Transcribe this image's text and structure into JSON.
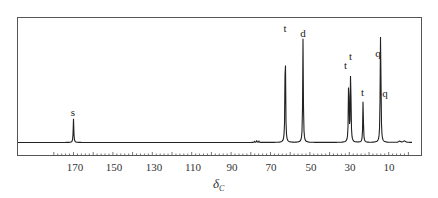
{
  "chart_data": {
    "type": "line",
    "title": "",
    "subtitle": "",
    "xlabel": "δC",
    "xlabel_main": "δ",
    "xlabel_sub": "C",
    "ylabel": "",
    "x_reversed": true,
    "xlim": [
      180,
      0
    ],
    "grid": false,
    "legend": null,
    "x_ticks": [
      170,
      150,
      130,
      110,
      90,
      70,
      50,
      30,
      10
    ],
    "x_tick_labels": [
      "170",
      "150",
      "130",
      "110",
      "90",
      "70",
      "50",
      "30",
      "10"
    ],
    "peaks": [
      {
        "ppm": 170.0,
        "height": 0.22,
        "multiplicity": "s"
      },
      {
        "ppm": 77.0,
        "height": 0.01,
        "multiplicity": "",
        "note": "solvent triplet"
      },
      {
        "ppm": 62.5,
        "height": 1.0,
        "multiplicity": "t"
      },
      {
        "ppm": 53.5,
        "height": 0.96,
        "multiplicity": "d"
      },
      {
        "ppm": 30.3,
        "height": 0.66,
        "multiplicity": "t"
      },
      {
        "ppm": 29.3,
        "height": 0.74,
        "multiplicity": "t"
      },
      {
        "ppm": 23.0,
        "height": 0.4,
        "multiplicity": "t"
      },
      {
        "ppm": 14.2,
        "height": 0.76,
        "multiplicity": "q"
      },
      {
        "ppm": 14.0,
        "height": 0.45,
        "multiplicity": "q"
      }
    ],
    "annotations": [
      "s",
      "t",
      "d",
      "t",
      "t",
      "t",
      "q",
      "q"
    ]
  },
  "peak_labels": [
    "s",
    "t",
    "d",
    "t",
    "t",
    "t",
    "q",
    "q"
  ],
  "axis": {
    "tick_labels": [
      "170",
      "150",
      "130",
      "110",
      "90",
      "70",
      "50",
      "30",
      "10"
    ],
    "title_main": "δ",
    "title_sub": "C"
  }
}
